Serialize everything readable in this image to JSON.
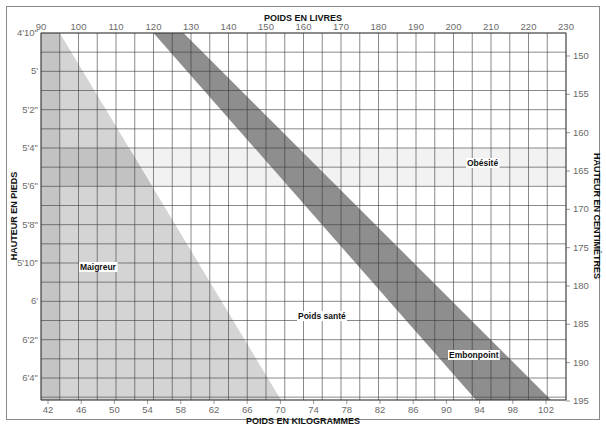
{
  "chart_data": {
    "type": "heatmap",
    "title": "",
    "x_top": {
      "label": "POIDS EN LIVRES",
      "ticks": [
        90,
        100,
        110,
        120,
        130,
        140,
        150,
        160,
        170,
        180,
        190,
        200,
        210,
        220,
        230
      ],
      "range": [
        90,
        230
      ]
    },
    "x_bottom": {
      "label": "POIDS EN KILOGRAMMES",
      "ticks": [
        42,
        46,
        50,
        54,
        58,
        62,
        66,
        70,
        74,
        78,
        82,
        86,
        90,
        94,
        98,
        102
      ]
    },
    "y_left": {
      "label": "HAUTEUR EN PIEDS",
      "ticks": [
        "4'10\"",
        "5'",
        "5'2\"",
        "5'4\"",
        "5'6\"",
        "5'8\"",
        "5'10\"",
        "6'",
        "6'2\"",
        "6'4\""
      ]
    },
    "y_right": {
      "label": "HAUTEUR EN CENTIMÈTRES",
      "ticks": [
        150,
        155,
        160,
        165,
        170,
        175,
        180,
        185,
        190,
        195
      ]
    },
    "zones": [
      {
        "name": "Maigreur",
        "color": "#c8c8c8",
        "boundary_lb_at_top": 95,
        "boundary_lb_at_bottom": 154
      },
      {
        "name": "Poids santé",
        "color": "#ffffff"
      },
      {
        "name": "Embonpoint",
        "color": "#8c8c8c",
        "band_lb_at_top": [
          120,
          128
        ],
        "band_lb_at_bottom": [
          206,
          226
        ]
      },
      {
        "name": "Obésité",
        "color": "#ffffff"
      }
    ],
    "grid": true
  },
  "labels": {
    "x_top_title": "POIDS EN LIVRES",
    "x_bottom_title": "POIDS EN KILOGRAMMES",
    "y_left_title": "HAUTEUR EN PIEDS",
    "y_right_title": "HAUTEUR EN CENTIMÈTRES",
    "zone_underweight": "Maigreur",
    "zone_healthy": "Poids santé",
    "zone_overweight": "Embonpoint",
    "zone_obese": "Obésité"
  }
}
